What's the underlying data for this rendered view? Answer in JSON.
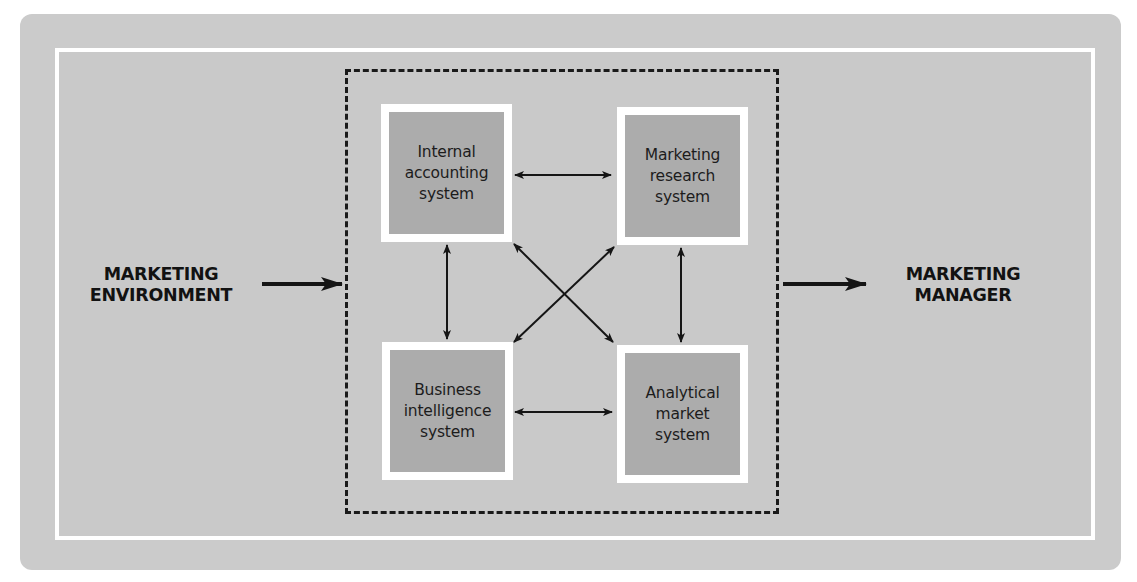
{
  "diagram": {
    "type": "marketing-information-system",
    "colors": {
      "panel_background": "#cbcbcb",
      "frame_border": "#ffffff",
      "box_fill": "#acacac",
      "box_border": "#ffffff",
      "text": "#1c1c1c",
      "arrow": "#151515",
      "dashed_border": "#1a1a1a"
    },
    "input": {
      "label": "MARKETING\nENVIRONMENT"
    },
    "output": {
      "label": "MARKETING\nMANAGER"
    },
    "systems": [
      {
        "id": "internal-accounting",
        "label": "Internal\naccounting\nsystem",
        "position": "top-left"
      },
      {
        "id": "marketing-research",
        "label": "Marketing\nresearch\nsystem",
        "position": "top-right"
      },
      {
        "id": "business-intelligence",
        "label": "Business\nintelligence\nsystem",
        "position": "bottom-left"
      },
      {
        "id": "analytical-market",
        "label": "Analytical\nmarket\nsystem",
        "position": "bottom-right"
      }
    ],
    "connections": [
      {
        "from": "MARKETING ENVIRONMENT",
        "to": "system-group",
        "direction": "one-way"
      },
      {
        "from": "system-group",
        "to": "MARKETING MANAGER",
        "direction": "one-way"
      },
      {
        "from": "internal-accounting",
        "to": "marketing-research",
        "direction": "two-way"
      },
      {
        "from": "business-intelligence",
        "to": "analytical-market",
        "direction": "two-way"
      },
      {
        "from": "internal-accounting",
        "to": "business-intelligence",
        "direction": "two-way"
      },
      {
        "from": "marketing-research",
        "to": "analytical-market",
        "direction": "two-way"
      },
      {
        "from": "internal-accounting",
        "to": "analytical-market",
        "direction": "two-way"
      },
      {
        "from": "marketing-research",
        "to": "business-intelligence",
        "direction": "two-way"
      }
    ]
  }
}
